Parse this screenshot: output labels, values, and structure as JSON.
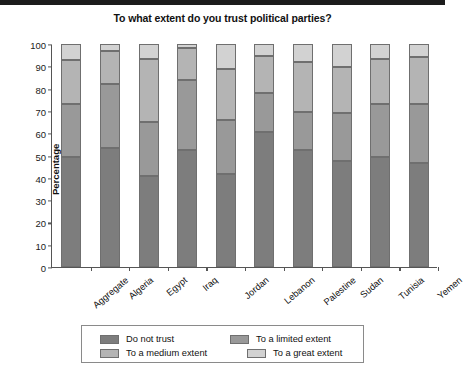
{
  "title": "To what extent do you trust political parties?",
  "ylabel": "Percentage",
  "legend": {
    "items": [
      {
        "label": "Do not trust",
        "color": "#7d7d7d"
      },
      {
        "label": "To a limited extent",
        "color": "#999999"
      },
      {
        "label": "To a medium extent",
        "color": "#b4b4b4"
      },
      {
        "label": "To a great extent",
        "color": "#d2d2d2"
      }
    ]
  },
  "yticks": [
    "0",
    "10",
    "20",
    "30",
    "40",
    "50",
    "60",
    "70",
    "80",
    "90",
    "100"
  ],
  "chart_data": {
    "type": "bar",
    "title": "To what extent do you trust political parties?",
    "xlabel": "",
    "ylabel": "Percentage",
    "ylim": [
      0,
      100
    ],
    "grid": false,
    "stacked": true,
    "legend_position": "bottom",
    "categories": [
      "Aggregate",
      "Algeria",
      "Egypt",
      "Iraq",
      "Jordan",
      "Lebanon",
      "Palestine",
      "Sudan",
      "Tunisia",
      "Yemen"
    ],
    "series": [
      {
        "name": "Do not trust",
        "color": "#7d7d7d",
        "values": [
          49.5,
          53.5,
          41.0,
          52.5,
          41.5,
          60.5,
          52.5,
          47.5,
          49.5,
          46.5
        ]
      },
      {
        "name": "To a limited extent",
        "color": "#999999",
        "values": [
          23.5,
          28.5,
          24.0,
          31.5,
          24.5,
          17.5,
          17.0,
          21.5,
          23.5,
          26.5
        ]
      },
      {
        "name": "To a medium extent",
        "color": "#b4b4b4",
        "values": [
          20.0,
          15.0,
          28.5,
          14.0,
          23.0,
          16.5,
          22.5,
          20.5,
          20.5,
          21.0
        ]
      },
      {
        "name": "To a great extent",
        "color": "#d2d2d2",
        "values": [
          7.0,
          3.0,
          6.5,
          2.0,
          11.0,
          5.5,
          8.0,
          10.5,
          6.5,
          6.0
        ]
      }
    ],
    "cumulative_boundaries": [
      {
        "category": "Aggregate",
        "boundaries": [
          49.5,
          73.0,
          93.0,
          100
        ]
      },
      {
        "category": "Algeria",
        "boundaries": [
          53.5,
          82.0,
          97.0,
          100
        ]
      },
      {
        "category": "Egypt",
        "boundaries": [
          41.0,
          65.0,
          93.5,
          100
        ]
      },
      {
        "category": "Iraq",
        "boundaries": [
          52.5,
          84.0,
          98.0,
          100
        ]
      },
      {
        "category": "Jordan",
        "boundaries": [
          41.5,
          66.0,
          89.0,
          100
        ]
      },
      {
        "category": "Lebanon",
        "boundaries": [
          60.5,
          78.0,
          94.5,
          100
        ]
      },
      {
        "category": "Palestine",
        "boundaries": [
          52.5,
          69.5,
          92.0,
          100
        ]
      },
      {
        "category": "Sudan",
        "boundaries": [
          47.5,
          69.0,
          89.5,
          100
        ]
      },
      {
        "category": "Tunisia",
        "boundaries": [
          49.5,
          73.0,
          93.5,
          100
        ]
      },
      {
        "category": "Yemen",
        "boundaries": [
          46.5,
          73.0,
          94.0,
          100
        ]
      }
    ]
  }
}
